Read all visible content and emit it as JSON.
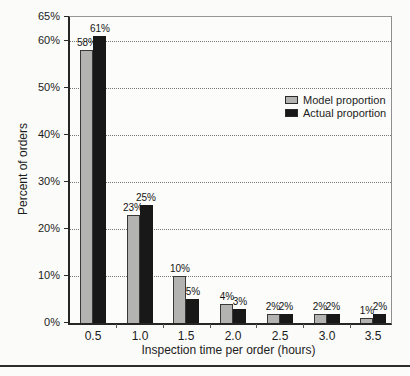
{
  "chart_data": {
    "type": "bar",
    "title": "",
    "xlabel": "Inspection time per order (hours)",
    "ylabel": "Percent of orders",
    "categories": [
      "0.5",
      "1.0",
      "1.5",
      "2.0",
      "2.5",
      "3.0",
      "3.5"
    ],
    "series": [
      {
        "name": "Model proportion",
        "color": "#b3b3b1",
        "border_color": "#383838",
        "values": [
          58,
          23,
          10,
          4,
          2,
          2,
          1
        ],
        "labels": [
          "58%",
          "23%",
          "10%",
          "4%",
          "2%",
          "2%",
          "1%"
        ]
      },
      {
        "name": "Actual proportion",
        "color": "#181818",
        "border_color": "#181818",
        "values": [
          61,
          25,
          5,
          3,
          2,
          2,
          2
        ],
        "labels": [
          "61%",
          "25%",
          "5%",
          "3%",
          "2%",
          "2%",
          "2%"
        ]
      }
    ],
    "ylim": [
      0,
      65
    ],
    "yticks": [
      {
        "value": 0,
        "label": "0%"
      },
      {
        "value": 10,
        "label": "10%"
      },
      {
        "value": 20,
        "label": "20%"
      },
      {
        "value": 30,
        "label": "30%"
      },
      {
        "value": 40,
        "label": "40%"
      },
      {
        "value": 50,
        "label": "50%"
      },
      {
        "value": 60,
        "label": "60%"
      },
      {
        "value": 65,
        "label": "65%"
      }
    ],
    "grid": "horizontal dotted at 10% to 60%",
    "legend_position": "inside right-center",
    "bar_labels_shown": true
  },
  "page": {
    "bottom_rule": true
  },
  "colors": {
    "background": "#fbfbf9",
    "model_bar": "#b3b3b1",
    "actual_bar": "#181818",
    "gridline": "#787878",
    "axis": "#262626",
    "frame": "#979797"
  }
}
